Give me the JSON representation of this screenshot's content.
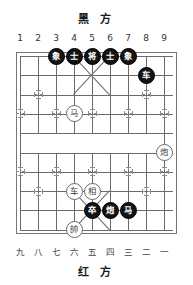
{
  "board": {
    "title_top": "黑 方",
    "title_bottom": "红 方",
    "files_top": [
      "1",
      "2",
      "3",
      "4",
      "5",
      "6",
      "7",
      "8",
      "9"
    ],
    "files_bottom": [
      "九",
      "八",
      "七",
      "六",
      "五",
      "四",
      "三",
      "二",
      "一"
    ],
    "colors": {
      "grid": "#6b6b6b",
      "grid_light": "#9a9a9a",
      "black_piece_bg": "#141414",
      "black_piece_fg": "#ffffff",
      "red_piece_bg": "#ffffff",
      "red_piece_fg": "#3a3a3a",
      "background": "#ffffff"
    },
    "columns": 9,
    "rows": 10,
    "pieces": [
      {
        "name": "black-elephant-c3",
        "char": "象",
        "side": "black",
        "col": 3,
        "row": 1
      },
      {
        "name": "black-advisor-c4",
        "char": "士",
        "side": "black",
        "col": 4,
        "row": 1
      },
      {
        "name": "black-general-c5",
        "char": "将",
        "side": "black",
        "col": 5,
        "row": 1
      },
      {
        "name": "black-advisor-c6",
        "char": "士",
        "side": "black",
        "col": 6,
        "row": 1
      },
      {
        "name": "black-elephant-c7",
        "char": "象",
        "side": "black",
        "col": 7,
        "row": 1
      },
      {
        "name": "black-chariot-c8",
        "char": "车",
        "side": "black",
        "col": 8,
        "row": 2
      },
      {
        "name": "red-horse-c4",
        "char": "马",
        "side": "red",
        "col": 4,
        "row": 4
      },
      {
        "name": "red-cannon-c9",
        "char": "炮",
        "side": "red",
        "col": 9,
        "row": 6
      },
      {
        "name": "red-chariot-c4",
        "char": "车",
        "side": "red",
        "col": 4,
        "row": 8
      },
      {
        "name": "red-elephant-c5",
        "char": "相",
        "side": "red",
        "col": 5,
        "row": 8
      },
      {
        "name": "black-pawn-c5",
        "char": "卒",
        "side": "black",
        "col": 5,
        "row": 9
      },
      {
        "name": "black-cannon-c6",
        "char": "炮",
        "side": "black",
        "col": 6,
        "row": 9
      },
      {
        "name": "black-horse-c7",
        "char": "马",
        "side": "black",
        "col": 7,
        "row": 9
      },
      {
        "name": "red-general-c4",
        "char": "帥",
        "side": "red",
        "col": 4,
        "row": 10
      }
    ],
    "star_points": [
      {
        "col": 2,
        "row": 3
      },
      {
        "col": 8,
        "row": 3
      },
      {
        "col": 3,
        "row": 4
      },
      {
        "col": 5,
        "row": 4
      },
      {
        "col": 7,
        "row": 4
      },
      {
        "col": 1,
        "row": 4
      },
      {
        "col": 9,
        "row": 4
      },
      {
        "col": 1,
        "row": 7
      },
      {
        "col": 9,
        "row": 7
      },
      {
        "col": 3,
        "row": 7
      },
      {
        "col": 5,
        "row": 7
      },
      {
        "col": 7,
        "row": 7
      },
      {
        "col": 2,
        "row": 8
      },
      {
        "col": 8,
        "row": 8
      }
    ]
  }
}
